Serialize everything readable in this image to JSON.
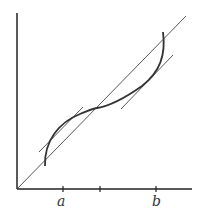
{
  "diagram": {
    "type": "function-graph",
    "colors": {
      "axis": "#222222",
      "curve": "#333333",
      "line": "#444444",
      "text": "#333333"
    },
    "axes": {
      "origin": [
        17,
        189
      ],
      "y_axis_top": [
        17,
        13
      ],
      "x_axis_end": [
        192,
        189
      ]
    },
    "diagonal": {
      "from": [
        17,
        189
      ],
      "to": [
        186,
        16
      ]
    },
    "ticks": [
      {
        "x": 63,
        "label": "a"
      },
      {
        "x": 100,
        "label": ""
      },
      {
        "x": 156,
        "label": "b"
      }
    ],
    "labels": {
      "a": "a",
      "b": "b"
    },
    "curve_path": "M45,166 C44,140 60,122 80,114 C90,110 94,108 97,108 C110,106 125,98 142,86 C160,72 166,55 163,32",
    "tangent_lines": [
      {
        "from": [
          39,
          152
        ],
        "to": [
          83,
          107
        ]
      },
      {
        "from": [
          121,
          109
        ],
        "to": [
          173,
          55
        ]
      }
    ]
  }
}
